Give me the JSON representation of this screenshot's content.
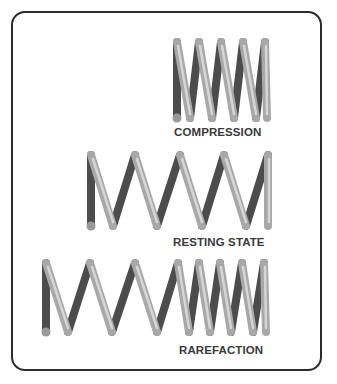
{
  "diagram": {
    "panels": [
      {
        "id": "compression",
        "label": "COMPRESSION",
        "coils": 5,
        "spacing": "tight"
      },
      {
        "id": "resting",
        "label": "RESTING STATE",
        "coils": 5,
        "spacing": "even"
      },
      {
        "id": "rarefaction",
        "label": "RAREFACTION",
        "coils": 8,
        "spacing": "stretched-then-tight"
      }
    ],
    "colors": {
      "border": "#2b2b2b",
      "label": "#3a3a3a",
      "coil_dark": "#4a4a4a",
      "coil_light": "#c8c8c8",
      "coil_end": "#9a9a9a"
    }
  }
}
